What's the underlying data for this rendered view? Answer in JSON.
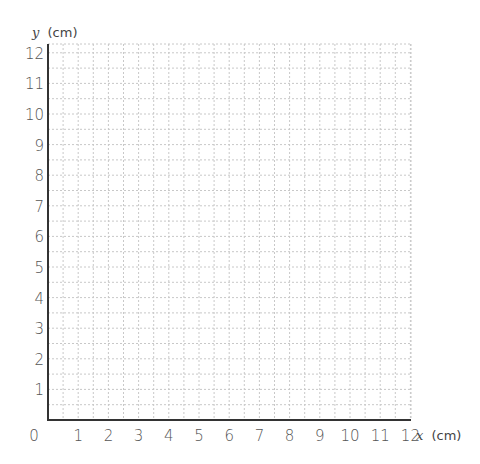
{
  "chart_data": {
    "type": "line",
    "title": "",
    "xlabel": "x (cm)",
    "ylabel": "y (cm)",
    "x_ticks": [
      "0",
      "1",
      "2",
      "3",
      "4",
      "5",
      "6",
      "7",
      "8",
      "9",
      "10",
      "11",
      "12"
    ],
    "y_ticks": [
      "1",
      "2",
      "3",
      "4",
      "5",
      "6",
      "7",
      "8",
      "9",
      "10",
      "11",
      "12"
    ],
    "xlim": [
      0,
      12
    ],
    "ylim": [
      0,
      12
    ],
    "grid": true,
    "grid_minor_step": 0.5,
    "grid_style": "dotted",
    "series": []
  },
  "labels": {
    "origin": "0",
    "x_axis_var": "x",
    "x_axis_unit": "(cm)",
    "y_axis_var": "y",
    "y_axis_unit": "(cm)"
  },
  "colors": {
    "axis": "#333333",
    "grid": "#c8c8c8",
    "text": "#555555"
  }
}
